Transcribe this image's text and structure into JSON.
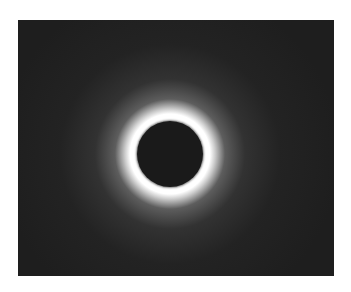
{
  "image": {
    "subject": "total solar eclipse",
    "description": "Dark moon disc surrounded by a bright white solar corona against a dark sky",
    "colors": {
      "page_background": "#ffffff",
      "sky": "#1e1e1e",
      "corona": "#ffffff",
      "moon": "#1a1a1a"
    }
  }
}
